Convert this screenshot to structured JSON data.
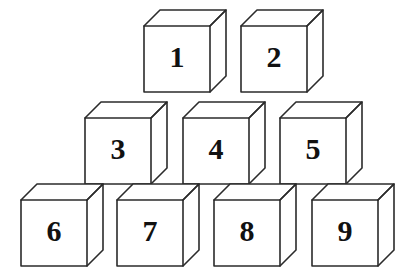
{
  "figure": {
    "background_color": "#ffffff",
    "edge_color": "#2b2b2b",
    "face_color": "#ffffff",
    "label_color": "#111111",
    "canvas": {
      "width": 409,
      "height": 276
    }
  },
  "geometry": {
    "face_size": 66,
    "depth_x": 16,
    "depth_y": 16,
    "stroke_width": 1.6,
    "label_font_size": 30
  },
  "rows": [
    {
      "row_name": "top-row",
      "row_index": 1,
      "face_top": 26,
      "cube_count": 2,
      "cubes": [
        {
          "label": "1",
          "face_left": 144,
          "face_top": 26
        },
        {
          "label": "2",
          "face_left": 241,
          "face_top": 26
        }
      ]
    },
    {
      "row_name": "middle-row",
      "row_index": 2,
      "face_top": 118,
      "cube_count": 3,
      "cubes": [
        {
          "label": "3",
          "face_left": 85,
          "face_top": 118
        },
        {
          "label": "4",
          "face_left": 183,
          "face_top": 118
        },
        {
          "label": "5",
          "face_left": 280,
          "face_top": 118
        }
      ]
    },
    {
      "row_name": "bottom-row",
      "row_index": 3,
      "face_top": 200,
      "cube_count": 4,
      "cubes": [
        {
          "label": "6",
          "face_left": 21,
          "face_top": 200
        },
        {
          "label": "7",
          "face_left": 117,
          "face_top": 200
        },
        {
          "label": "8",
          "face_left": 214,
          "face_top": 200
        },
        {
          "label": "9",
          "face_left": 312,
          "face_top": 200
        }
      ]
    }
  ]
}
